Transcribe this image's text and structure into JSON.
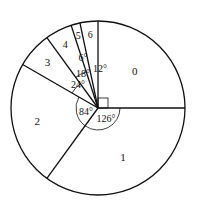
{
  "chart_data": {
    "type": "pie",
    "title": "",
    "categories": [
      "0",
      "1",
      "2",
      "3",
      "4",
      "5",
      "6"
    ],
    "values": [
      90,
      126,
      84,
      24,
      18,
      6,
      12
    ],
    "unit": "degrees",
    "angle_labels": [
      "",
      "126°",
      "84°",
      "24°",
      "18°",
      "6°",
      "12°"
    ],
    "right_angle_marker_on": "0",
    "legend": "none",
    "center": [
      98,
      108
    ],
    "radius": 87
  },
  "colors": {
    "stroke": "#111111",
    "fill": "#ffffff"
  }
}
